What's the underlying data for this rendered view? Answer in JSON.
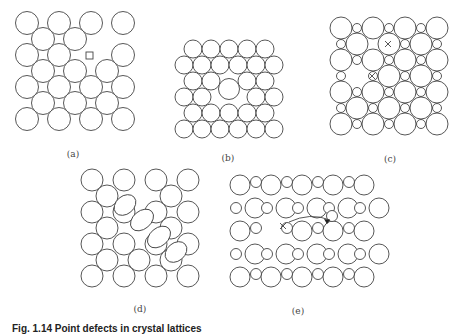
{
  "figure": {
    "caption": "Fig. 1.14  Point defects in crystal lattices",
    "stroke_color": "#444444",
    "panels": [
      {
        "id": "a",
        "label": "(a)",
        "label_pos": [
          73,
          149
        ],
        "description": "square lattice with a vacancy (marked by square)",
        "big": {
          "x0": 27,
          "y0": 23,
          "dx": 32,
          "dy": 32,
          "cols": 4,
          "rows": 4,
          "r": 11.5
        },
        "mid": {
          "x0": 43,
          "y0": 39,
          "dx": 32,
          "dy": 32,
          "cols": 3,
          "rows": 3,
          "r": 11.5,
          "omit": [
            [
              0,
              2
            ]
          ]
        },
        "big_omit": [
          [
            1,
            2
          ]
        ],
        "vacancy_square": {
          "x": 86,
          "y": 52,
          "size": 7
        }
      },
      {
        "id": "b",
        "label": "(b)",
        "label_pos": [
          228,
          153
        ],
        "description": "close packed lattice with a substitutional larger atom",
        "rows": [
          {
            "y": 49,
            "x0": 193,
            "n": 5
          },
          {
            "y": 65,
            "x0": 184,
            "n": 6
          },
          {
            "y": 81,
            "x0": 193,
            "n": 2
          },
          {
            "y": 81,
            "x0": 247,
            "n": 2
          },
          {
            "y": 97,
            "x0": 184,
            "n": 2
          },
          {
            "y": 97,
            "x0": 256,
            "n": 2
          },
          {
            "y": 113,
            "x0": 193,
            "n": 5
          },
          {
            "y": 129,
            "x0": 184,
            "n": 6
          }
        ],
        "dx": 18,
        "r": 9,
        "large_atom": {
          "x": 229,
          "y": 89,
          "r": 10.5
        }
      },
      {
        "id": "c",
        "label": "(c)",
        "label_pos": [
          390,
          154
        ],
        "description": "ionic lattice with vacancy pair (marked by x)",
        "big_corner": {
          "x0": 341,
          "y0": 28,
          "dx": 32,
          "dy": 32,
          "cols": 4,
          "rows": 4,
          "r": 11
        },
        "big_mid": {
          "x0": 357,
          "y0": 44,
          "dx": 32,
          "dy": 32,
          "cols": 3,
          "rows": 3,
          "r": 11
        },
        "big_mid_omit": [
          [
            1,
            0
          ]
        ],
        "small_rows_on_corner_rows": {
          "x0": 357,
          "y0": 28,
          "dx": 32,
          "dy": 32,
          "cols": 3,
          "rows": 4,
          "r": 4.5
        },
        "small_rows_on_mid_rows": {
          "x0": 341,
          "y0": 44,
          "dx": 32,
          "dy": 32,
          "cols": 4,
          "rows": 3,
          "r": 4.5
        },
        "small_omit_mid": [
          [
            0,
            1
          ]
        ],
        "x_marks": [
          [
            388,
            44
          ],
          [
            372,
            76
          ]
        ]
      },
      {
        "id": "d",
        "label": "(d)",
        "label_pos": [
          140,
          304
        ],
        "description": "lattice with dislocation / distorted atoms (ellipses)",
        "big": {
          "x0": 92,
          "y0": 180,
          "dx": 32,
          "dy": 32,
          "cols": 4,
          "rows": 4,
          "r": 11
        },
        "mid": {
          "x0": 107,
          "y0": 196,
          "dx": 32,
          "dy": 32,
          "cols": 3,
          "rows": 3,
          "r": 11
        },
        "mid_omit": [
          [
            0,
            1
          ],
          [
            1,
            1
          ]
        ],
        "ellipses": [
          {
            "cx": 125,
            "cy": 205,
            "rx": 12,
            "ry": 9,
            "rot": -40
          },
          {
            "cx": 142,
            "cy": 220,
            "rx": 13,
            "ry": 9,
            "rot": -40
          },
          {
            "cx": 159,
            "cy": 237,
            "rx": 13,
            "ry": 9,
            "rot": -40
          },
          {
            "cx": 176,
            "cy": 252,
            "rx": 12,
            "ry": 9,
            "rot": -40
          }
        ]
      },
      {
        "id": "e",
        "label": "(e)",
        "label_pos": [
          298,
          306
        ],
        "description": "interstitial migration with arrow and vacancy (x)",
        "rows": [
          {
            "y": 185,
            "start_big": true,
            "x0": 240
          },
          {
            "y": 208,
            "start_big": false,
            "x0": 236
          },
          {
            "y": 231,
            "start_big": true,
            "x0": 240
          },
          {
            "y": 254,
            "start_big": false,
            "x0": 236
          },
          {
            "y": 277,
            "start_big": true,
            "x0": 240
          }
        ],
        "pitch": 31,
        "big_r": 10,
        "small_r": 5.5,
        "count_big": 5,
        "count_small": 5,
        "omit_big": [
          [
            2,
            1
          ]
        ],
        "x_mark": [
          283,
          226
        ],
        "arrow": {
          "path": "M 289 222 Q 310 212 330 220",
          "head": [
            330,
            220
          ]
        },
        "extra_small": {
          "x": 332,
          "y": 216,
          "r": 5.5
        }
      }
    ]
  }
}
